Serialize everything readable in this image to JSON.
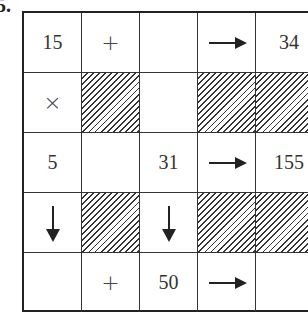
{
  "problem_label": "5.",
  "grid": {
    "rows": [
      [
        {
          "type": "text",
          "value": "15"
        },
        {
          "type": "op",
          "value": "+"
        },
        {
          "type": "empty",
          "value": ""
        },
        {
          "type": "arrow-right",
          "value": ""
        },
        {
          "type": "text",
          "value": "34"
        }
      ],
      [
        {
          "type": "op",
          "value": "×"
        },
        {
          "type": "shaded",
          "value": ""
        },
        {
          "type": "empty",
          "value": ""
        },
        {
          "type": "shaded",
          "value": ""
        },
        {
          "type": "shaded",
          "value": ""
        }
      ],
      [
        {
          "type": "text",
          "value": "5"
        },
        {
          "type": "empty",
          "value": ""
        },
        {
          "type": "text",
          "value": "31"
        },
        {
          "type": "arrow-right",
          "value": ""
        },
        {
          "type": "text",
          "value": "155"
        }
      ],
      [
        {
          "type": "arrow-down",
          "value": ""
        },
        {
          "type": "shaded",
          "value": ""
        },
        {
          "type": "arrow-down",
          "value": ""
        },
        {
          "type": "shaded",
          "value": ""
        },
        {
          "type": "shaded",
          "value": ""
        }
      ],
      [
        {
          "type": "empty",
          "value": ""
        },
        {
          "type": "op",
          "value": "+"
        },
        {
          "type": "text",
          "value": "50"
        },
        {
          "type": "arrow-right",
          "value": ""
        },
        {
          "type": "empty",
          "value": ""
        }
      ]
    ]
  }
}
